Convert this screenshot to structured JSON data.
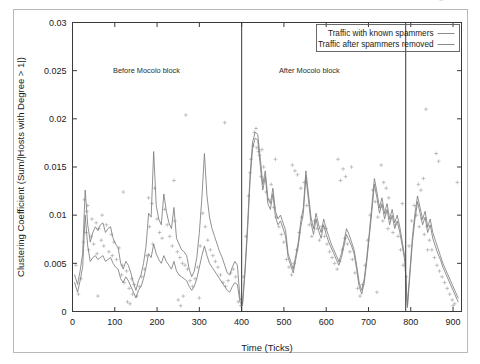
{
  "chart_data": {
    "type": "line",
    "title": "",
    "xlabel": "Time (Ticks)",
    "ylabel": "Clustering Coefficient (Sum/|Hosts with Degree > 1|)",
    "xlim": [
      0,
      920
    ],
    "ylim": [
      0,
      0.03
    ],
    "xticks": [
      0,
      100,
      200,
      300,
      400,
      500,
      600,
      700,
      800,
      900
    ],
    "xtick_labels": [
      "0",
      "100",
      "200",
      "300",
      "400",
      "500",
      "600",
      "700",
      "800",
      "900"
    ],
    "yticks": [
      0,
      0.005,
      0.01,
      0.015,
      0.02,
      0.025,
      0.03
    ],
    "ytick_labels": [
      "0",
      "0.005",
      "0.01",
      "0.015",
      "0.02",
      "0.025",
      "0.03"
    ],
    "grid": false,
    "legend_position": "top-right",
    "legend": [
      {
        "label": "Traffic with known spammers",
        "color": "#7e7e7e"
      },
      {
        "label": "Traffic after spammers removed",
        "color": "#7e7e7e"
      }
    ],
    "annotations": [
      {
        "text": "Before Mocolo block",
        "x": 175,
        "y": 0.0248
      },
      {
        "text": "After Mocolo block",
        "x": 560,
        "y": 0.0248
      }
    ],
    "vertical_markers": [
      {
        "x": 400,
        "label": "Mocolo block",
        "color": "#4a4a4a"
      },
      {
        "x": 788,
        "label": "",
        "color": "#4a4a4a"
      }
    ],
    "series": [
      {
        "name": "Traffic with known spammers",
        "x": [
          5,
          12,
          18,
          24,
          30,
          36,
          42,
          48,
          54,
          60,
          66,
          72,
          78,
          84,
          90,
          96,
          102,
          108,
          114,
          120,
          126,
          132,
          138,
          144,
          150,
          156,
          162,
          168,
          174,
          180,
          186,
          192,
          198,
          204,
          210,
          216,
          222,
          228,
          234,
          240,
          246,
          252,
          258,
          264,
          270,
          276,
          282,
          288,
          294,
          300,
          306,
          312,
          318,
          324,
          330,
          336,
          342,
          348,
          354,
          360,
          366,
          372,
          378,
          384,
          390,
          396,
          402,
          408,
          414,
          420,
          426,
          432,
          438,
          444,
          450,
          456,
          462,
          468,
          474,
          480,
          486,
          492,
          498,
          504,
          510,
          516,
          522,
          528,
          534,
          540,
          546,
          552,
          558,
          564,
          570,
          576,
          582,
          588,
          594,
          600,
          606,
          612,
          618,
          624,
          630,
          636,
          642,
          648,
          654,
          660,
          666,
          672,
          678,
          684,
          690,
          696,
          702,
          708,
          714,
          720,
          726,
          732,
          738,
          744,
          750,
          756,
          762,
          768,
          774,
          780,
          786,
          792,
          798,
          804,
          810,
          816,
          822,
          828,
          834,
          840,
          846,
          852,
          858,
          864,
          870,
          876,
          882,
          888,
          894,
          900,
          906,
          912
        ],
        "values": [
          0.0038,
          0.0028,
          0.0042,
          0.006,
          0.0126,
          0.009,
          0.0072,
          0.0082,
          0.0088,
          0.0084,
          0.009,
          0.0092,
          0.0082,
          0.0086,
          0.0088,
          0.0076,
          0.007,
          0.0066,
          0.005,
          0.0044,
          0.0052,
          0.0048,
          0.004,
          0.003,
          0.0022,
          0.0032,
          0.0038,
          0.005,
          0.0068,
          0.0102,
          0.0098,
          0.0166,
          0.011,
          0.0096,
          0.009,
          0.0122,
          0.0104,
          0.0092,
          0.0086,
          0.0108,
          0.0076,
          0.007,
          0.0064,
          0.0062,
          0.0058,
          0.0044,
          0.0036,
          0.0042,
          0.0056,
          0.0082,
          0.0118,
          0.0164,
          0.012,
          0.0098,
          0.0086,
          0.0078,
          0.007,
          0.0062,
          0.0056,
          0.0048,
          0.004,
          0.0038,
          0.0046,
          0.0052,
          0.0048,
          0.0014,
          0.0008,
          0.0044,
          0.009,
          0.0142,
          0.0176,
          0.0186,
          0.0184,
          0.016,
          0.0132,
          0.0146,
          0.0118,
          0.0112,
          0.0128,
          0.0104,
          0.0096,
          0.01,
          0.0092,
          0.0084,
          0.006,
          0.0052,
          0.0044,
          0.0058,
          0.0072,
          0.0094,
          0.0108,
          0.0146,
          0.0122,
          0.0098,
          0.0086,
          0.0102,
          0.009,
          0.0082,
          0.0096,
          0.0086,
          0.0078,
          0.007,
          0.0064,
          0.0058,
          0.0052,
          0.006,
          0.0072,
          0.0086,
          0.008,
          0.0072,
          0.0064,
          0.0048,
          0.003,
          0.0022,
          0.0034,
          0.0056,
          0.0082,
          0.011,
          0.0138,
          0.0124,
          0.0108,
          0.0118,
          0.0102,
          0.0112,
          0.0096,
          0.0106,
          0.0092,
          0.01,
          0.0088,
          0.0072,
          0.0056,
          0.0006,
          0.0042,
          0.0078,
          0.0102,
          0.012,
          0.0108,
          0.0096,
          0.0104,
          0.0088,
          0.0096,
          0.0082,
          0.0074,
          0.0066,
          0.0058,
          0.005,
          0.0044,
          0.0038,
          0.0032,
          0.0026,
          0.002,
          0.0014
        ]
      },
      {
        "name": "Traffic after spammers removed",
        "x": [
          5,
          12,
          18,
          24,
          30,
          36,
          42,
          48,
          54,
          60,
          66,
          72,
          78,
          84,
          90,
          96,
          102,
          108,
          114,
          120,
          126,
          132,
          138,
          144,
          150,
          156,
          162,
          168,
          174,
          180,
          186,
          192,
          198,
          204,
          210,
          216,
          222,
          228,
          234,
          240,
          246,
          252,
          258,
          264,
          270,
          276,
          282,
          288,
          294,
          300,
          306,
          312,
          318,
          324,
          330,
          336,
          342,
          348,
          354,
          360,
          366,
          372,
          378,
          384,
          390,
          396,
          402,
          408,
          414,
          420,
          426,
          432,
          438,
          444,
          450,
          456,
          462,
          468,
          474,
          480,
          486,
          492,
          498,
          504,
          510,
          516,
          522,
          528,
          534,
          540,
          546,
          552,
          558,
          564,
          570,
          576,
          582,
          588,
          594,
          600,
          606,
          612,
          618,
          624,
          630,
          636,
          642,
          648,
          654,
          660,
          666,
          672,
          678,
          684,
          690,
          696,
          702,
          708,
          714,
          720,
          726,
          732,
          738,
          744,
          750,
          756,
          762,
          768,
          774,
          780,
          786,
          792,
          798,
          804,
          810,
          816,
          822,
          828,
          834,
          840,
          846,
          852,
          858,
          864,
          870,
          876,
          882,
          888,
          894,
          900,
          906,
          912
        ],
        "values": [
          0.003,
          0.002,
          0.0032,
          0.0046,
          0.01,
          0.0068,
          0.0052,
          0.0056,
          0.0058,
          0.0054,
          0.0056,
          0.0058,
          0.0052,
          0.0054,
          0.0056,
          0.005,
          0.0046,
          0.0044,
          0.0034,
          0.003,
          0.0036,
          0.0032,
          0.0026,
          0.002,
          0.0014,
          0.0022,
          0.0026,
          0.0034,
          0.0046,
          0.006,
          0.0056,
          0.007,
          0.006,
          0.0054,
          0.005,
          0.0058,
          0.0052,
          0.0048,
          0.0044,
          0.0052,
          0.0042,
          0.0038,
          0.0036,
          0.0034,
          0.0032,
          0.0026,
          0.0022,
          0.0026,
          0.0034,
          0.0046,
          0.0058,
          0.0068,
          0.0058,
          0.005,
          0.0046,
          0.0042,
          0.0038,
          0.0034,
          0.003,
          0.0026,
          0.0022,
          0.002,
          0.0026,
          0.003,
          0.0028,
          0.001,
          0.0006,
          0.004,
          0.0084,
          0.0136,
          0.017,
          0.018,
          0.0178,
          0.0152,
          0.0126,
          0.014,
          0.0112,
          0.0106,
          0.0122,
          0.0098,
          0.009,
          0.0094,
          0.0086,
          0.0078,
          0.0056,
          0.0048,
          0.004,
          0.0054,
          0.0068,
          0.0088,
          0.0102,
          0.014,
          0.0116,
          0.0092,
          0.008,
          0.0096,
          0.0084,
          0.0076,
          0.009,
          0.008,
          0.0072,
          0.0066,
          0.006,
          0.0054,
          0.0048,
          0.0056,
          0.0068,
          0.008,
          0.0074,
          0.0068,
          0.006,
          0.0044,
          0.0026,
          0.0018,
          0.003,
          0.0052,
          0.0078,
          0.0104,
          0.0132,
          0.0118,
          0.0102,
          0.0112,
          0.0096,
          0.0106,
          0.009,
          0.01,
          0.0086,
          0.0094,
          0.0082,
          0.0068,
          0.0052,
          0.0004,
          0.0038,
          0.0072,
          0.0096,
          0.0114,
          0.0102,
          0.009,
          0.0098,
          0.0082,
          0.009,
          0.0076,
          0.0068,
          0.006,
          0.0054,
          0.0046,
          0.004,
          0.0034,
          0.0028,
          0.0022,
          0.0016,
          0.001
        ]
      }
    ],
    "scatter": {
      "name": "per-tick samples",
      "marker": "plus",
      "color": "#9d9d9d",
      "x": [
        8,
        14,
        20,
        26,
        28,
        32,
        34,
        38,
        44,
        46,
        50,
        56,
        58,
        62,
        68,
        70,
        74,
        80,
        86,
        92,
        94,
        98,
        104,
        110,
        116,
        118,
        122,
        128,
        134,
        140,
        142,
        146,
        152,
        158,
        164,
        170,
        176,
        182,
        188,
        190,
        194,
        200,
        206,
        212,
        218,
        224,
        230,
        236,
        242,
        248,
        254,
        260,
        266,
        272,
        278,
        284,
        290,
        296,
        302,
        308,
        314,
        320,
        326,
        332,
        338,
        344,
        350,
        356,
        362,
        368,
        374,
        380,
        386,
        392,
        398,
        404,
        410,
        416,
        422,
        428,
        434,
        440,
        446,
        452,
        458,
        464,
        470,
        476,
        482,
        488,
        494,
        500,
        506,
        512,
        518,
        524,
        530,
        536,
        542,
        548,
        554,
        560,
        566,
        572,
        578,
        584,
        590,
        596,
        602,
        608,
        614,
        620,
        626,
        632,
        638,
        644,
        650,
        656,
        662,
        668,
        674,
        680,
        686,
        692,
        698,
        704,
        710,
        716,
        722,
        728,
        734,
        740,
        746,
        752,
        758,
        764,
        770,
        776,
        782,
        790,
        796,
        802,
        808,
        814,
        820,
        826,
        832,
        838,
        844,
        850,
        856,
        862,
        868,
        874,
        880,
        886,
        892,
        898,
        904,
        910,
        36,
        60,
        120,
        180,
        240,
        300,
        360,
        420,
        480,
        540,
        600,
        660,
        720,
        780,
        840,
        900,
        130,
        136,
        250,
        256,
        262,
        268,
        430,
        436,
        442,
        448,
        520,
        526,
        532,
        628,
        634,
        640,
        646,
        730,
        736,
        742,
        748,
        818,
        824,
        830,
        836,
        860,
        866,
        872
      ],
      "y": [
        0.0048,
        0.0018,
        0.0034,
        0.0072,
        0.0116,
        0.0082,
        0.0104,
        0.0064,
        0.0078,
        0.0096,
        0.007,
        0.0092,
        0.006,
        0.0086,
        0.0074,
        0.01,
        0.0068,
        0.009,
        0.0062,
        0.008,
        0.0058,
        0.0072,
        0.0054,
        0.0066,
        0.0038,
        0.0048,
        0.003,
        0.0042,
        0.0024,
        0.0034,
        0.0018,
        0.0028,
        0.0016,
        0.0026,
        0.0036,
        0.0044,
        0.0058,
        0.0088,
        0.0112,
        0.007,
        0.0128,
        0.0096,
        0.0082,
        0.0076,
        0.0106,
        0.009,
        0.0078,
        0.0068,
        0.0094,
        0.0062,
        0.0056,
        0.005,
        0.0048,
        0.0044,
        0.0032,
        0.0026,
        0.0034,
        0.0046,
        0.0068,
        0.0102,
        0.0088,
        0.0074,
        0.0064,
        0.0058,
        0.0052,
        0.0046,
        0.0038,
        0.003,
        0.0026,
        0.0032,
        0.004,
        0.0044,
        0.0036,
        0.001,
        0.0006,
        0.0036,
        0.0078,
        0.012,
        0.0158,
        0.0172,
        0.019,
        0.0166,
        0.014,
        0.015,
        0.0124,
        0.0116,
        0.0132,
        0.0108,
        0.0098,
        0.0088,
        0.008,
        0.0072,
        0.0054,
        0.0046,
        0.0038,
        0.005,
        0.0064,
        0.0082,
        0.0098,
        0.0134,
        0.011,
        0.009,
        0.0078,
        0.0094,
        0.0086,
        0.0074,
        0.0088,
        0.0078,
        0.007,
        0.0062,
        0.0056,
        0.005,
        0.0044,
        0.0052,
        0.0064,
        0.0076,
        0.007,
        0.0062,
        0.0054,
        0.004,
        0.0024,
        0.0016,
        0.0028,
        0.0048,
        0.0074,
        0.01,
        0.0126,
        0.0114,
        0.0098,
        0.0108,
        0.0094,
        0.0102,
        0.0086,
        0.0096,
        0.0082,
        0.009,
        0.0078,
        0.0064,
        0.0048,
        0.0036,
        0.0068,
        0.0094,
        0.011,
        0.01,
        0.0088,
        0.0096,
        0.008,
        0.0088,
        0.0074,
        0.0064,
        0.0056,
        0.0048,
        0.0042,
        0.0036,
        0.003,
        0.0024,
        0.0018,
        0.0012,
        0.0008,
        0.0134,
        0.011,
        0.0016,
        0.0124,
        0.0118,
        0.0136,
        0.0014,
        0.0196,
        0.0144,
        0.0158,
        0.0128,
        0.0086,
        0.015,
        0.002,
        0.0112,
        0.0064,
        0.0006,
        0.001,
        0.0008,
        0.0012,
        0.0006,
        0.0016,
        0.0204,
        0.0186,
        0.017,
        0.0162,
        0.0168,
        0.0152,
        0.0146,
        0.0142,
        0.0158,
        0.0136,
        0.0148,
        0.014,
        0.0152,
        0.0134,
        0.0128,
        0.0118,
        0.0132,
        0.0126,
        0.0138,
        0.021,
        0.0164,
        0.0156
      ]
    }
  }
}
